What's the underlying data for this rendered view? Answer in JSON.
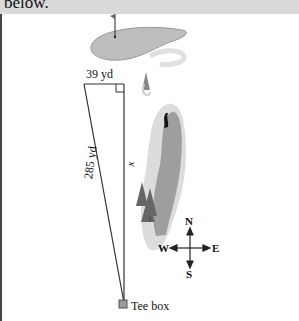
{
  "header": {
    "text": "below."
  },
  "diagram": {
    "labels": {
      "top_distance": "39 yd",
      "hypotenuse": "285 yd",
      "unknown_side": "x",
      "tee": "Tee box"
    },
    "compass": {
      "north": "N",
      "south": "S",
      "east": "E",
      "west": "W"
    },
    "colors": {
      "green": "#a9a9a9",
      "fairway": "#9c9c9c",
      "rough": "#d6d6d6",
      "lines": "#333333",
      "header_bg": "#d9d9d9"
    }
  }
}
